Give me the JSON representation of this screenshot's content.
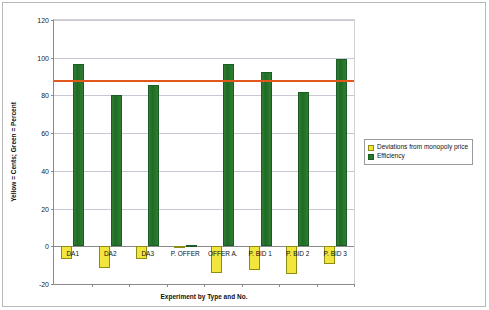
{
  "chart_data": {
    "type": "bar",
    "title": "",
    "xlabel": "Experiment by Type and No.",
    "ylabel": "Yellow = Cents; Green = Percent",
    "categories": [
      "DA1",
      "DA2",
      "DA3",
      "P. OFFER",
      "OFFER A.",
      "P. BID 1",
      "P. BID 2",
      "P. BID 3"
    ],
    "series": [
      {
        "name": "Deviations from monopoly price",
        "color": "#f2e53c",
        "values": [
          -7.0,
          -11.5,
          -7.0,
          -0.5,
          -14.0,
          -12.8,
          -14.5,
          -9.5
        ]
      },
      {
        "name": "Efficiency",
        "color": "#227a2e",
        "values": [
          96.8,
          80.4,
          85.5,
          0.6,
          96.8,
          92.6,
          82.0,
          99.5
        ]
      }
    ],
    "reference_line": {
      "label": "monopoly price reference",
      "value": 88.0,
      "color": "#e0561b"
    },
    "ylim": [
      -20,
      120
    ],
    "yticks": [
      "120",
      "100",
      "80",
      "60",
      "40",
      "20",
      "0",
      "-20"
    ],
    "ytick_values": [
      120,
      100,
      80,
      60,
      40,
      20,
      0,
      -20
    ],
    "grid": true,
    "legend_position": "right"
  },
  "legend": {
    "items": [
      {
        "label": "Deviations from monopoly price",
        "swatch": "yellow"
      },
      {
        "label": "Efficiency",
        "swatch": "green"
      }
    ]
  }
}
